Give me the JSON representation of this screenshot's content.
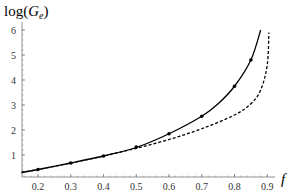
{
  "chart_data": {
    "type": "line",
    "title": "",
    "xlabel": "f",
    "ylabel": "log(G_e)",
    "ylabel_main": "log(",
    "ylabel_var": "G",
    "ylabel_sub": "e",
    "ylabel_close": ")",
    "xlim": [
      0.15,
      0.92
    ],
    "ylim": [
      0.1,
      6.2
    ],
    "x_ticks": [
      0.2,
      0.3,
      0.4,
      0.5,
      0.6,
      0.7,
      0.8,
      0.9
    ],
    "x_tick_labels": [
      "0.2",
      "0.3",
      "0.4",
      "0.5",
      "0.6",
      "0.7",
      "0.8",
      "0.9"
    ],
    "y_ticks": [
      1,
      2,
      3,
      4,
      5,
      6
    ],
    "y_tick_labels": [
      "1",
      "2",
      "3",
      "4",
      "5",
      "6"
    ],
    "grid": false,
    "legend": null,
    "series": [
      {
        "name": "solid curve",
        "style": "solid",
        "color": "#000000",
        "x": [
          0.15,
          0.2,
          0.3,
          0.4,
          0.5,
          0.6,
          0.7,
          0.75,
          0.8,
          0.85,
          0.88
        ],
        "values": [
          0.3,
          0.42,
          0.68,
          0.96,
          1.3,
          1.85,
          2.55,
          3.05,
          3.75,
          4.8,
          6.0
        ]
      },
      {
        "name": "dashed curve",
        "style": "dashed",
        "color": "#000000",
        "x": [
          0.15,
          0.2,
          0.3,
          0.4,
          0.5,
          0.6,
          0.7,
          0.8,
          0.85,
          0.88,
          0.9,
          0.905
        ],
        "values": [
          0.3,
          0.42,
          0.68,
          0.96,
          1.27,
          1.62,
          2.05,
          2.6,
          3.05,
          3.6,
          4.6,
          5.9
        ]
      },
      {
        "name": "data points",
        "style": "markers",
        "color": "#000000",
        "x": [
          0.2,
          0.3,
          0.4,
          0.5,
          0.6,
          0.7,
          0.8,
          0.85
        ],
        "values": [
          0.42,
          0.68,
          0.96,
          1.32,
          1.85,
          2.55,
          3.75,
          4.8
        ]
      }
    ]
  }
}
